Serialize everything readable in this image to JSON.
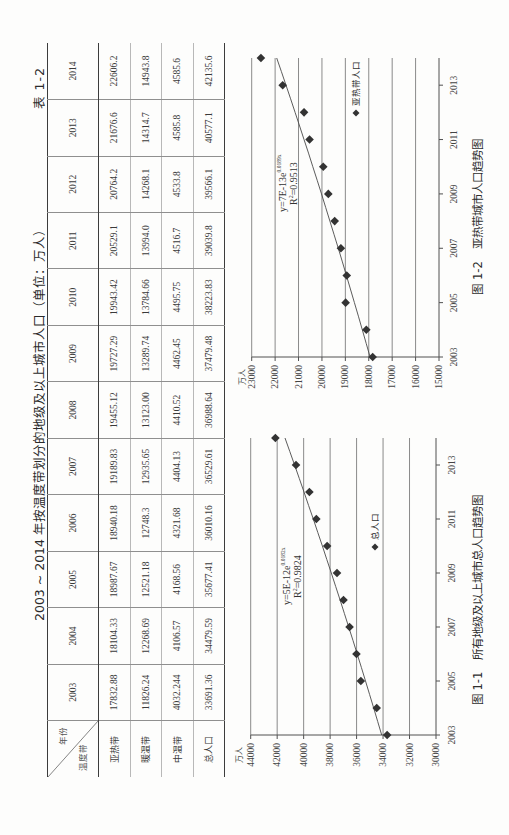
{
  "document": {
    "table_label": "表 1-2",
    "title": "2003 ~ 2014 年按温度带划分的地级及以上城市人口（单位：万人）"
  },
  "table": {
    "corner": {
      "column_header": "年份",
      "row_header": "温度带"
    },
    "years": [
      "2003",
      "2004",
      "2005",
      "2006",
      "2007",
      "2008",
      "2009",
      "2010",
      "2011",
      "2012",
      "2013",
      "2014"
    ],
    "rows": [
      {
        "label": "亚热带",
        "values": [
          "17832.88",
          "18104.33",
          "18987.67",
          "18940.18",
          "19189.83",
          "19455.12",
          "19727.29",
          "19943.42",
          "20529.1",
          "20764.2",
          "21676.6",
          "22606.2"
        ]
      },
      {
        "label": "暖温带",
        "values": [
          "11826.24",
          "12268.69",
          "12521.18",
          "12748.3",
          "12935.65",
          "13123.00",
          "13289.74",
          "13784.66",
          "13994.0",
          "14268.1",
          "14314.7",
          "14943.8"
        ]
      },
      {
        "label": "中温带",
        "values": [
          "4032.244",
          "4106.57",
          "4168.56",
          "4321.68",
          "4404.13",
          "4410.52",
          "4462.45",
          "4495.75",
          "4516.7",
          "4533.8",
          "4585.8",
          "4585.6"
        ]
      },
      {
        "label": "总人口",
        "values": [
          "33691.36",
          "34479.59",
          "35677.41",
          "36010.16",
          "36529.61",
          "36988.64",
          "37479.48",
          "38223.83",
          "39039.8",
          "39566.1",
          "40577.1",
          "42135.6"
        ]
      }
    ]
  },
  "chart_data": [
    {
      "type": "scatter",
      "caption": {
        "number": "图 1-1",
        "title": "所有地级及以上城市总人口趋势图"
      },
      "xlabel": "",
      "ylabel": "万人",
      "xlim": [
        2003,
        2014
      ],
      "ylim": [
        30000,
        44000
      ],
      "xticks": [
        2003,
        2005,
        2007,
        2009,
        2011,
        2013
      ],
      "yticks": [
        30000,
        32000,
        34000,
        36000,
        38000,
        40000,
        42000,
        44000
      ],
      "grid": true,
      "legend": {
        "position": "inside-right",
        "label": "总人口",
        "marker": "diamond"
      },
      "series": [
        {
          "name": "总人口",
          "marker": "diamond",
          "x": [
            2003,
            2004,
            2005,
            2006,
            2007,
            2008,
            2009,
            2010,
            2011,
            2012,
            2013,
            2014
          ],
          "y": [
            33691.36,
            34479.59,
            35677.41,
            36010.16,
            36529.61,
            36988.64,
            37479.48,
            38223.83,
            39039.8,
            39566.1,
            40577.1,
            42135.6
          ]
        }
      ],
      "trendline": {
        "type": "exponential",
        "equation_prefix": "y=5E-12e",
        "equation_exponent": "0.0182x",
        "r_label": "R",
        "r_sup": "2",
        "r_value": "=0.9824",
        "fit_start": 34100,
        "fit_end": 41410
      }
    },
    {
      "type": "scatter",
      "caption": {
        "number": "图 1-2",
        "title": "亚热带城市人口趋势图"
      },
      "xlabel": "",
      "ylabel": "万人",
      "xlim": [
        2003,
        2014
      ],
      "ylim": [
        15000,
        23000
      ],
      "xticks": [
        2003,
        2005,
        2007,
        2009,
        2011,
        2013
      ],
      "yticks": [
        15000,
        16000,
        17000,
        18000,
        19000,
        20000,
        21000,
        22000,
        23000
      ],
      "grid": true,
      "legend": {
        "position": "inside-right",
        "label": "亚热带人口",
        "marker": "diamond"
      },
      "series": [
        {
          "name": "亚热带人口",
          "marker": "diamond",
          "x": [
            2003,
            2004,
            2005,
            2006,
            2007,
            2008,
            2009,
            2010,
            2011,
            2012,
            2013,
            2014
          ],
          "y": [
            17832.88,
            18104.33,
            18987.67,
            18940.18,
            19189.83,
            19455.12,
            19727.29,
            19943.42,
            20529.1,
            20764.2,
            21676.6,
            22606.2
          ]
        }
      ],
      "trendline": {
        "type": "exponential",
        "equation_prefix": "y=7E-13e",
        "equation_exponent": "0.0189x",
        "r_label": "R",
        "r_sup": "2",
        "r_value": "=0.9513",
        "fit_start": 17945,
        "fit_end": 21932
      }
    }
  ]
}
